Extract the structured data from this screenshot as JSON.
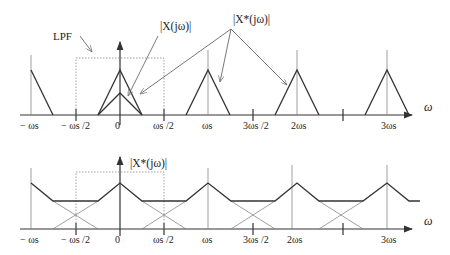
{
  "figure": {
    "top_panel": {
      "axis_label": "ω",
      "curve_labels": {
        "lpf": "LPF",
        "baseband": "|X(jω)|",
        "sampled": "|X*(jω)|"
      },
      "ticks": [
        "− ωs",
        "− ωs /2",
        "0",
        "ωs /2",
        "ωs",
        "3ωs /2",
        "2ωs",
        "3ωs"
      ],
      "description": "Sampled spectrum without aliasing: replicas of baseband triangle centered at multiples of ωs, separated by gaps; LPF passband from −ωs/2 to ωs/2."
    },
    "bottom_panel": {
      "axis_label": "ω",
      "curve_label": "|X*(jω)|",
      "ticks": [
        "− ωs",
        "− ωs /2",
        "0",
        "ωs /2",
        "ωs",
        "3ωs /2",
        "2ωs",
        "3ωs"
      ],
      "description": "Sampled spectrum with aliasing: replicas overlap (dashed individual triangles), summed spectrum shows flat regions between peaks."
    }
  }
}
